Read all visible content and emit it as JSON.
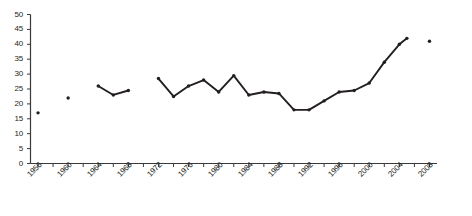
{
  "chart_data": {
    "type": "line",
    "title": "",
    "subtitle": "",
    "xlabel": "",
    "ylabel": "",
    "xlim": [
      1955,
      2009
    ],
    "ylim": [
      0,
      50
    ],
    "grid": false,
    "legend": null,
    "legend_position": "none",
    "marker": "filled-circle",
    "line_color": "#231f20",
    "marker_color": "#231f20",
    "y_ticks": [
      0,
      5,
      10,
      15,
      20,
      25,
      30,
      35,
      40,
      45,
      50
    ],
    "y_tick_labels": [
      "0",
      "5",
      "10",
      "15",
      "20",
      "25",
      "30",
      "35",
      "40",
      "45",
      "50"
    ],
    "x_tick_labels": [
      "1956",
      "1960",
      "1964",
      "1968",
      "1972",
      "1976",
      "1980",
      "1984",
      "1988",
      "1992",
      "1996",
      "2000",
      "2004",
      "2008"
    ],
    "x_minor_tick_interval": 2,
    "x_major_tick_interval": 4,
    "series": [
      {
        "name": "series-1",
        "x": [
          1956,
          1960,
          1964,
          1966,
          1968,
          1972,
          1974,
          1976,
          1978,
          1980,
          1982,
          1984,
          1986,
          1988,
          1990,
          1992,
          1994,
          1996,
          1998,
          2000,
          2002,
          2004,
          2005,
          2008
        ],
        "values": [
          17,
          22,
          26,
          23,
          24.5,
          28.5,
          22.5,
          26,
          28,
          24,
          29.5,
          23,
          24,
          23.5,
          18,
          18,
          21,
          24,
          24.5,
          27,
          34,
          40,
          42,
          41
        ],
        "segments": [
          {
            "x": [
              1956
            ],
            "values": [
              17
            ]
          },
          {
            "x": [
              1960
            ],
            "values": [
              22
            ]
          },
          {
            "x": [
              1964,
              1966,
              1968
            ],
            "values": [
              26,
              23,
              24.5
            ]
          },
          {
            "x": [
              1972,
              1974,
              1976,
              1978,
              1980,
              1982,
              1984,
              1986,
              1988,
              1990,
              1992,
              1994,
              1996,
              1998,
              2000,
              2002,
              2004,
              2005
            ],
            "values": [
              28.5,
              22.5,
              26,
              28,
              24,
              29.5,
              23,
              24,
              23.5,
              18,
              18,
              21,
              24,
              24.5,
              27,
              34,
              40,
              42
            ]
          },
          {
            "x": [
              2008
            ],
            "values": [
              41
            ]
          }
        ]
      }
    ]
  }
}
